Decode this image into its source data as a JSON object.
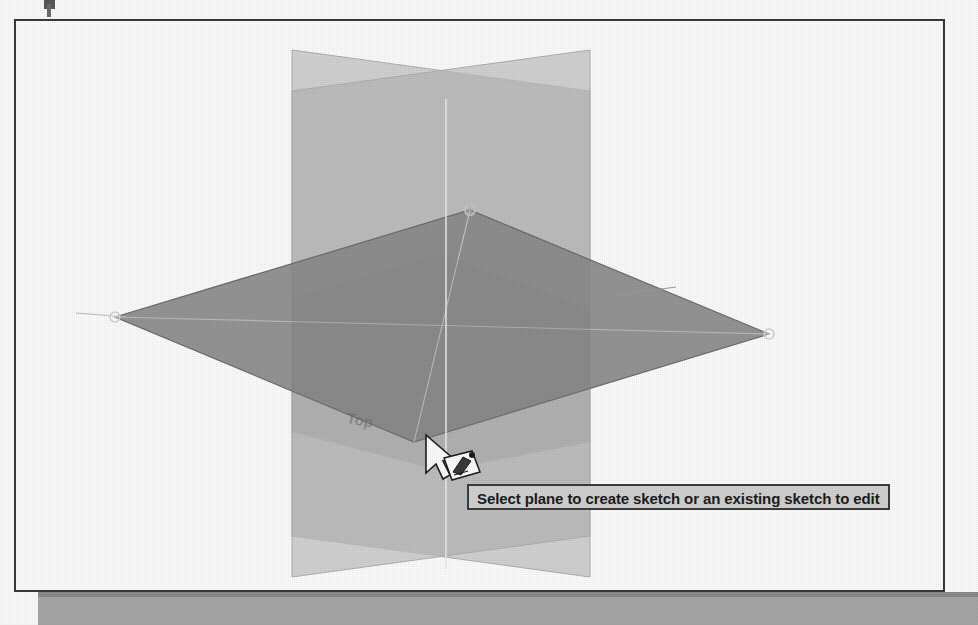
{
  "window": {
    "title": "Sketch plane selection viewport",
    "background_color": "#ffffff",
    "frame_border_color": "#3a3a3a"
  },
  "tooltip": {
    "text": "Select plane to create sketch or an existing sketch to edit",
    "background_color": "#d4d4d4",
    "border_color": "#3d3d3d",
    "text_color": "#1c1c1c"
  },
  "cursor": {
    "name": "arrow-with-sketch-badge",
    "x": 424,
    "y": 432,
    "badge_label": "sketch-plane-badge"
  },
  "scene": {
    "type": "cad-3d-datum-planes",
    "planes": [
      {
        "name": "front-plane",
        "orientation": "vertical",
        "fill_color": "#c9c9c9",
        "edge_color": "#b4b4b4",
        "opacity": 0.6
      },
      {
        "name": "right-plane",
        "orientation": "vertical",
        "fill_color": "#c9c9c9",
        "edge_color": "#b4b4b4",
        "opacity": 0.6
      },
      {
        "name": "top-plane",
        "orientation": "horizontal",
        "state": "highlighted",
        "fill_color": "#8e8e8e",
        "edge_color": "#6f6f6f",
        "opacity": 0.85
      }
    ],
    "handles": [
      {
        "name": "plane-handle-top",
        "x": 468,
        "y": 208
      },
      {
        "name": "plane-handle-left",
        "x": 113,
        "y": 315
      },
      {
        "name": "plane-handle-right",
        "x": 767,
        "y": 332
      },
      {
        "name": "plane-handle-bottom",
        "x": 412,
        "y": 440
      }
    ],
    "axes": [
      {
        "name": "vertical-axis",
        "color": "#e8e8e8"
      },
      {
        "name": "axis-line-left",
        "color": "#9b9b9b"
      },
      {
        "name": "axis-line-right",
        "color": "#9b9b9b"
      }
    ],
    "plane_edge_label": "Top"
  }
}
